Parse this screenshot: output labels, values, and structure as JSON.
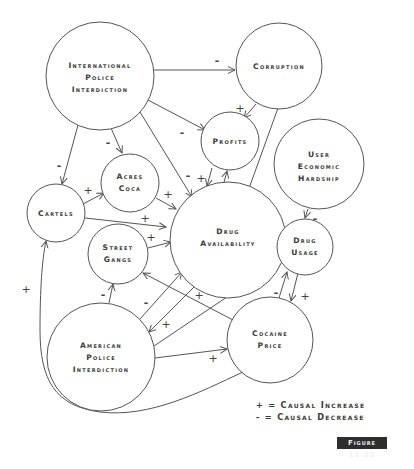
{
  "diagram": {
    "nodes": {
      "intl": {
        "lines": [
          "International",
          "Police",
          "Interdiction"
        ]
      },
      "corruption": {
        "lines": [
          "Corruption"
        ]
      },
      "profits": {
        "lines": [
          "Profits"
        ]
      },
      "hardship": {
        "lines": [
          "User",
          "Economic",
          "Hardship"
        ]
      },
      "acres": {
        "lines": [
          "Acres",
          "Coca"
        ]
      },
      "cartels": {
        "lines": [
          "Cartels"
        ]
      },
      "availability": {
        "lines": [
          "Drug",
          "Availability"
        ]
      },
      "gangs": {
        "lines": [
          "Street",
          "Gangs"
        ]
      },
      "usage": {
        "lines": [
          "Drug",
          "Usage"
        ]
      },
      "american": {
        "lines": [
          "American",
          "Police",
          "Interdiction"
        ]
      },
      "price": {
        "lines": [
          "Cocaine",
          "Price"
        ]
      }
    },
    "edges": [
      {
        "from": "International Police Interdiction",
        "to": "Corruption",
        "sign": "-"
      },
      {
        "from": "International Police Interdiction",
        "to": "Profits",
        "sign": "-"
      },
      {
        "from": "International Police Interdiction",
        "to": "Acres Coca",
        "sign": "-"
      },
      {
        "from": "International Police Interdiction",
        "to": "Cartels",
        "sign": "-"
      },
      {
        "from": "International Police Interdiction",
        "to": "Drug Availability",
        "sign": "-"
      },
      {
        "from": "Corruption",
        "to": "Profits",
        "sign": "+"
      },
      {
        "from": "Corruption",
        "to": "Drug Availability",
        "sign": "+"
      },
      {
        "from": "Profits",
        "to": "Drug Availability",
        "sign": "+"
      },
      {
        "from": "Drug Availability",
        "to": "Profits",
        "sign": "+"
      },
      {
        "from": "Cartels",
        "to": "Acres Coca",
        "sign": "+"
      },
      {
        "from": "Cartels",
        "to": "Drug Availability",
        "sign": "+"
      },
      {
        "from": "Acres Coca",
        "to": "Drug Availability",
        "sign": "+"
      },
      {
        "from": "Street Gangs",
        "to": "Drug Availability",
        "sign": "+"
      },
      {
        "from": "Drug Availability",
        "to": "Drug Usage",
        "sign": "+"
      },
      {
        "from": "User Economic Hardship",
        "to": "Drug Usage",
        "sign": "-"
      },
      {
        "from": "American Police Interdiction",
        "to": "Street Gangs",
        "sign": "-"
      },
      {
        "from": "American Police Interdiction",
        "to": "Drug Availability",
        "sign": "-"
      },
      {
        "from": "Drug Availability",
        "to": "American Police Interdiction",
        "sign": "+"
      },
      {
        "from": "American Police Interdiction",
        "to": "Drug Usage",
        "sign": "-"
      },
      {
        "from": "American Police Interdiction",
        "to": "Cocaine Price",
        "sign": "+"
      },
      {
        "from": "Cocaine Price",
        "to": "Street Gangs",
        "sign": "+"
      },
      {
        "from": "Cocaine Price",
        "to": "Drug Usage",
        "sign": "-"
      },
      {
        "from": "Drug Usage",
        "to": "Cocaine Price",
        "sign": "+"
      },
      {
        "from": "Cocaine Price",
        "to": "Cartels",
        "sign": "+"
      }
    ],
    "signs": {
      "plus": "+",
      "minus": "-"
    }
  },
  "legend": {
    "increase": "+ = Causal Increase",
    "decrease": "- = Causal Decrease"
  },
  "figure_label": "Figure 11.15",
  "colors": {
    "stroke": "#555555",
    "text": "#3a3a3a",
    "badge_bg": "#2e2e2e",
    "badge_text": "#f0f0f0"
  }
}
